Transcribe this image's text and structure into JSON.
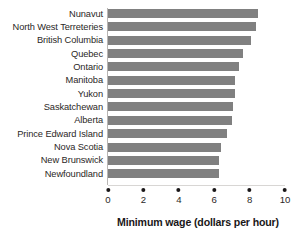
{
  "chart_data": {
    "type": "bar",
    "orientation": "horizontal",
    "title": "",
    "xlabel": "Minimum wage (dollars per hour)",
    "ylabel": "",
    "xlim": [
      0,
      10
    ],
    "xticks": [
      0,
      2,
      4,
      6,
      8,
      10
    ],
    "xtick_labels": [
      "0",
      "2",
      "4",
      "6",
      "8",
      "10"
    ],
    "grid": false,
    "legend": false,
    "bar_color": "#808080",
    "categories": [
      "Nunavut",
      "North West Terreteries",
      "British Columbia",
      "Quebec",
      "Ontario",
      "Manitoba",
      "Yukon",
      "Saskatchewan",
      "Alberta",
      "Prince Edward Island",
      "Nova Scotia",
      "New Brunswick",
      "Newfoundland"
    ],
    "values": [
      8.5,
      8.35,
      8.1,
      7.6,
      7.4,
      7.2,
      7.2,
      7.05,
      7.0,
      6.75,
      6.4,
      6.25,
      6.25
    ],
    "series": [
      {
        "name": "Minimum wage",
        "values": [
          8.5,
          8.35,
          8.1,
          7.6,
          7.4,
          7.2,
          7.2,
          7.05,
          7.0,
          6.75,
          6.4,
          6.25,
          6.25
        ]
      }
    ]
  },
  "axis": {
    "x_title": "Minimum wage (dollars per hour)"
  }
}
